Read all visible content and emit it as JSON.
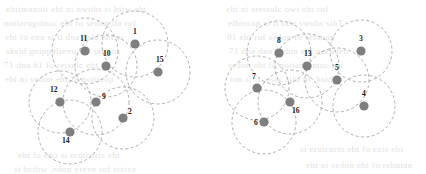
{
  "figure": {
    "background_color": "#ffffff",
    "node_color": "#7f7f7f",
    "disk_stroke_color": "#9a9a9a",
    "label_color": "#1a1a1a",
    "node_radius_px": 4.6,
    "width": 426,
    "height": 174,
    "clusters": [
      {
        "name": "left-cluster",
        "nodes": [
          {
            "label": "11",
            "cx": 85,
            "cy": 51,
            "r": 33,
            "lx": 80,
            "ly": 41
          },
          {
            "label": "1",
            "cx": 135,
            "cy": 44,
            "r": 33,
            "lx": 133,
            "ly": 34
          },
          {
            "label": "10",
            "cx": 106,
            "cy": 66,
            "r": 31,
            "lx": 103,
            "ly": 56
          },
          {
            "label": "15",
            "cx": 158,
            "cy": 72,
            "r": 32,
            "lx": 156,
            "ly": 62
          },
          {
            "label": "12",
            "cx": 60,
            "cy": 102,
            "r": 31,
            "lx": 50,
            "ly": 92
          },
          {
            "label": "9",
            "cx": 96,
            "cy": 102,
            "r": 33,
            "lx": 102,
            "ly": 99
          },
          {
            "label": "2",
            "cx": 123,
            "cy": 118,
            "r": 31,
            "lx": 128,
            "ly": 114
          },
          {
            "label": "14",
            "cx": 70,
            "cy": 132,
            "r": 32,
            "lx": 62,
            "ly": 143
          }
        ]
      },
      {
        "name": "right-cluster",
        "nodes": [
          {
            "label": "8",
            "cx": 279,
            "cy": 53,
            "r": 32,
            "lx": 277,
            "ly": 43
          },
          {
            "label": "13",
            "cx": 307,
            "cy": 66,
            "r": 32,
            "lx": 304,
            "ly": 56
          },
          {
            "label": "3",
            "cx": 361,
            "cy": 51,
            "r": 31,
            "lx": 359,
            "ly": 41
          },
          {
            "label": "5",
            "cx": 337,
            "cy": 80,
            "r": 32,
            "lx": 335,
            "ly": 70
          },
          {
            "label": "7",
            "cx": 257,
            "cy": 88,
            "r": 32,
            "lx": 252,
            "ly": 79
          },
          {
            "label": "16",
            "cx": 290,
            "cy": 102,
            "r": 32,
            "lx": 292,
            "ly": 113
          },
          {
            "label": "4",
            "cx": 364,
            "cy": 106,
            "r": 31,
            "lx": 362,
            "ly": 96
          },
          {
            "label": "6",
            "cx": 264,
            "cy": 122,
            "r": 32,
            "lx": 254,
            "ly": 125
          }
        ]
      }
    ],
    "background_text_lines": [
      {
        "text": "ehtimanoit eht ni nwohs si htiw eht",
        "x": 6,
        "y": 4
      },
      {
        "text": "noitarugifnoc eht fo sedon lla rof",
        "x": 4,
        "y": 18
      },
      {
        "text": "eht fo eno si ti dna ksid eht ni",
        "x": 5,
        "y": 32
      },
      {
        "text": "sksid gnippalrevo eht taht os",
        "x": 6,
        "y": 46
      },
      {
        "text": "71 dna 61 fo retsulc eht",
        "x": 4,
        "y": 60
      },
      {
        "text": "eht ni sedon eht fo noitisop",
        "x": 5,
        "y": 74
      },
      {
        "text": "eht ni sretsulc owt eht rof",
        "x": 226,
        "y": 4
      },
      {
        "text": "elbissop si ti taht swohs sihT",
        "x": 228,
        "y": 18
      },
      {
        "text": "01 eht rof sedon fo rebmun",
        "x": 227,
        "y": 32
      },
      {
        "text": "71 dna dna sedon eht neewteb",
        "x": 229,
        "y": 46
      },
      {
        "text": "sedon eht fo noitanibmoc eht",
        "x": 228,
        "y": 60
      },
      {
        "text": "ton si ti ,esac siht nI .ksid",
        "x": 230,
        "y": 74
      },
      {
        "text": "eht fo eno si erutcurts eht",
        "x": 18,
        "y": 150
      },
      {
        "text": "si hcihw ,edon yreve rof stsixe",
        "x": 14,
        "y": 164
      },
      {
        "text": "si erutcurts eht fo ezis eht",
        "x": 300,
        "y": 144
      },
      {
        "text": "eht ni sedon eht fo rebmun",
        "x": 306,
        "y": 160
      }
    ]
  }
}
